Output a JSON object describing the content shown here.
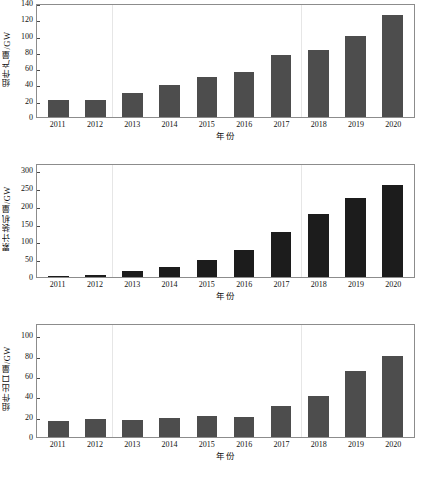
{
  "figure": {
    "background": "#ffffff",
    "bar_color_light": "#4d4d4d",
    "bar_color_dark": "#1c1c1c",
    "frame_color": "#8c8c8c"
  },
  "chart_data": [
    {
      "type": "bar",
      "title": "",
      "xlabel": "年份",
      "ylabel": "组件产量/GW",
      "categories": [
        "2011",
        "2012",
        "2013",
        "2014",
        "2015",
        "2016",
        "2017",
        "2018",
        "2019",
        "2020"
      ],
      "values": [
        20.5,
        21.5,
        30,
        39,
        49,
        55,
        76,
        82.5,
        99.5,
        125.5
      ],
      "ylim": [
        0,
        140
      ],
      "yticks": [
        0,
        20,
        40,
        60,
        80,
        100,
        120,
        140
      ],
      "grid": false,
      "legend": "none",
      "bar_color": "#4d4d4d"
    },
    {
      "type": "bar",
      "title": "",
      "xlabel": "年份",
      "ylabel": "累计装机量/GW",
      "categories": [
        "2011",
        "2012",
        "2013",
        "2014",
        "2015",
        "2016",
        "2017",
        "2018",
        "2019",
        "2020"
      ],
      "values": [
        2,
        5,
        16,
        28,
        48,
        75,
        127,
        176,
        223,
        258
      ],
      "ylim": [
        0,
        320
      ],
      "yticks": [
        0,
        50,
        100,
        150,
        200,
        250,
        300
      ],
      "grid": false,
      "legend": "none",
      "bar_color": "#1c1c1c"
    },
    {
      "type": "bar",
      "title": "",
      "xlabel": "年份",
      "ylabel": "组件出口量/GW",
      "categories": [
        "2011",
        "2012",
        "2013",
        "2014",
        "2015",
        "2016",
        "2017",
        "2018",
        "2019",
        "2020"
      ],
      "values": [
        15.5,
        18,
        16.5,
        18.5,
        21,
        19.5,
        30,
        40.5,
        65,
        80
      ],
      "ylim": [
        0,
        112
      ],
      "yticks": [
        0,
        20,
        40,
        60,
        80,
        100
      ],
      "grid": false,
      "legend": "none",
      "bar_color": "#4d4d4d"
    }
  ]
}
